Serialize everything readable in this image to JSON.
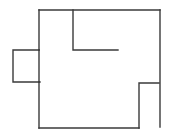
{
  "diagram": {
    "type": "floor-plan-outline",
    "width": 173,
    "height": 138,
    "background": "#ffffff",
    "stroke_color": "#3a3a3a",
    "stroke_width": 1.4,
    "walls": [
      {
        "name": "top-wall",
        "points": "39,10 160,10"
      },
      {
        "name": "left-wall-upper",
        "points": "39,10 39,50"
      },
      {
        "name": "left-wall-lower",
        "points": "39,82 39,128"
      },
      {
        "name": "left-alcove",
        "points": "39,50 13,50 13,82 40,82"
      },
      {
        "name": "left-wall-alcove-segment",
        "points": "39,50 39,82"
      },
      {
        "name": "inner-partition",
        "points": "73,10 73,50 118,50"
      },
      {
        "name": "right-wall",
        "points": "160,10 160,127"
      },
      {
        "name": "bottom-right-notch",
        "points": "159,83 139,83 139,128"
      },
      {
        "name": "bottom-wall",
        "points": "39,128 139,128"
      }
    ]
  }
}
